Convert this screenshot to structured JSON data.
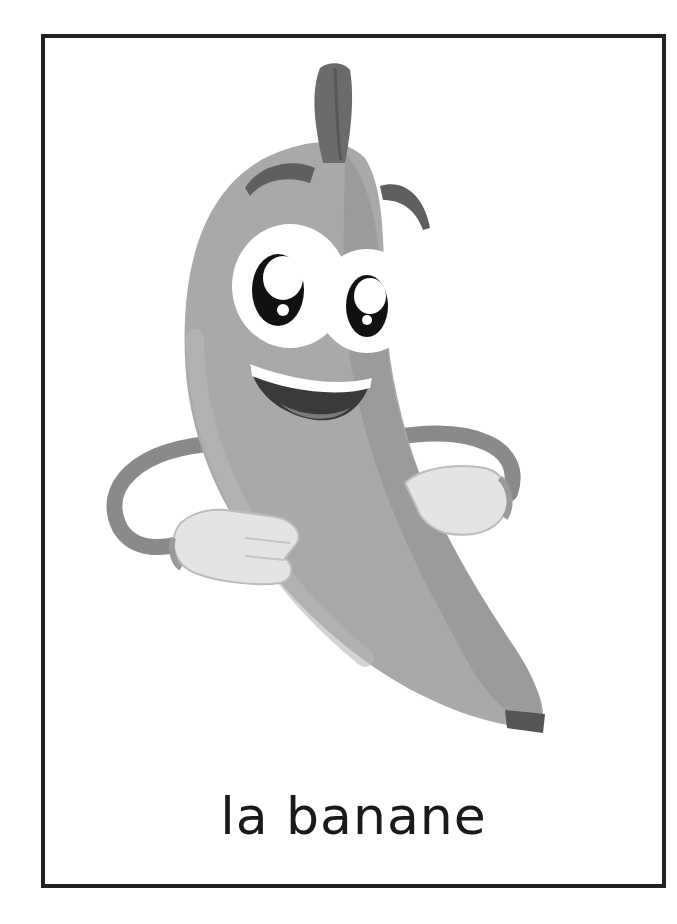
{
  "card": {
    "word": "la banane",
    "illustration": "banana-character-icon",
    "colors": {
      "border": "#222222",
      "background": "#ffffff",
      "banana_body": "#a9a9a9",
      "banana_shade": "#8c8c8c",
      "stem": "#6b6b6b",
      "glove": "#e4e4e4",
      "text": "#1a1a1a"
    }
  }
}
